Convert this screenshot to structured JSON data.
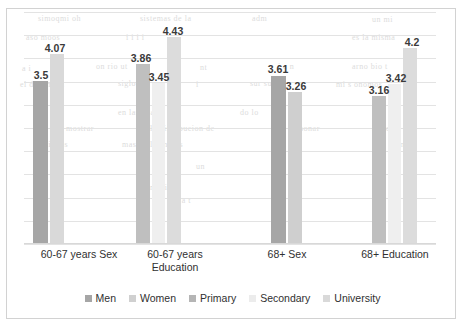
{
  "chart_data": {
    "type": "bar",
    "title": "",
    "subtitle": "",
    "xlabel": "",
    "ylabel": "",
    "ylim": [
      0,
      5
    ],
    "grid": true,
    "gridline_count": 10,
    "legend_position": "bottom",
    "axis_tick_labels": [],
    "categories": [
      "60-67 years Sex",
      "60-67 years Education",
      "68+ Sex",
      "68+ Education"
    ],
    "series": [
      {
        "name": "Men",
        "color": "#a6a6a6",
        "values": [
          3.5,
          null,
          3.61,
          null
        ]
      },
      {
        "name": "Women",
        "color": "#d9d9d9",
        "values": [
          4.07,
          null,
          3.26,
          null
        ]
      },
      {
        "name": "Primary",
        "color": "#bfbfbf",
        "values": [
          null,
          3.86,
          null,
          3.16
        ]
      },
      {
        "name": "Secondary",
        "color": "#efefef",
        "values": [
          null,
          3.45,
          null,
          3.42
        ]
      },
      {
        "name": "University",
        "color": "#dcdcdc",
        "values": [
          null,
          4.43,
          null,
          4.2
        ]
      }
    ],
    "bars": [
      {
        "group": "60-67 years Sex",
        "series": "Men",
        "value": 3.5,
        "label": "3.5",
        "color": "#a6a6a6",
        "x": 9,
        "w": 15,
        "label_x": 2,
        "label_dy": 13
      },
      {
        "group": "60-67 years Sex",
        "series": "Women",
        "value": 4.07,
        "label": "4.07",
        "color": "#d9d9d9",
        "x": 26,
        "w": 14,
        "label_x": 16,
        "label_dy": 13
      },
      {
        "group": "60-67 years Education",
        "series": "Primary",
        "value": 3.86,
        "label": "3.86",
        "color": "#bfbfbf",
        "x": 112,
        "w": 14,
        "label_x": 102,
        "label_dy": 13
      },
      {
        "group": "60-67 years Education",
        "series": "Secondary",
        "value": 3.45,
        "label": "3.45",
        "color": "#efefef",
        "x": 128,
        "w": 13,
        "label_x": 120,
        "label_dy": 13
      },
      {
        "group": "60-67 years Education",
        "series": "University",
        "value": 4.43,
        "label": "4.43",
        "color": "#dcdcdc",
        "x": 143,
        "w": 14,
        "label_x": 134,
        "label_dy": 13
      },
      {
        "group": "68+ Sex",
        "series": "Men",
        "value": 3.61,
        "label": "3.61",
        "color": "#a6a6a6",
        "x": 247,
        "w": 15,
        "label_x": 239,
        "label_dy": 13
      },
      {
        "group": "68+ Sex",
        "series": "Women",
        "value": 3.26,
        "label": "3.26",
        "color": "#cfcfcf",
        "x": 264,
        "w": 14,
        "label_x": 257,
        "label_dy": 13
      },
      {
        "group": "68+ Education",
        "series": "Primary",
        "value": 3.16,
        "label": "3.16",
        "color": "#bfbfbf",
        "x": 348,
        "w": 14,
        "label_x": 340,
        "label_dy": 13
      },
      {
        "group": "68+ Education",
        "series": "Secondary",
        "value": 3.42,
        "label": "3.42",
        "color": "#efefef",
        "x": 364,
        "w": 13,
        "label_x": 357,
        "label_dy": 13
      },
      {
        "group": "68+ Education",
        "series": "University",
        "value": 4.2,
        "label": "4.2",
        "color": "#dcdcdc",
        "x": 379,
        "w": 14,
        "label_x": 373,
        "label_dy": 13
      }
    ]
  },
  "axis": {
    "categories": [
      {
        "lines": [
          "60-67 years Sex"
        ],
        "x": 0,
        "w": 110
      },
      {
        "lines": [
          "60-67 years",
          "Education"
        ],
        "x": 96,
        "w": 110
      },
      {
        "lines": [
          "68+ Sex"
        ],
        "x": 218,
        "w": 90
      },
      {
        "lines": [
          "68+ Education"
        ],
        "x": 316,
        "w": 110
      }
    ]
  },
  "legend": {
    "items": [
      {
        "label": "Men",
        "color": "#a6a6a6"
      },
      {
        "label": "Women",
        "color": "#d0d0d0"
      },
      {
        "label": "Primary",
        "color": "#b5b5b5"
      },
      {
        "label": "Secondary",
        "color": "#ececec"
      },
      {
        "label": "University",
        "color": "#d9d9d9"
      }
    ]
  },
  "scan_artifacts": {
    "lines": [
      {
        "text": "simoqmi oh",
        "x": 38,
        "y": 14,
        "size": 8
      },
      {
        "text": "sistemas de la",
        "x": 140,
        "y": 14,
        "size": 8
      },
      {
        "text": "adm",
        "x": 252,
        "y": 14,
        "size": 8
      },
      {
        "text": "un mi",
        "x": 372,
        "y": 15,
        "size": 8
      },
      {
        "text": "aso moos",
        "x": 26,
        "y": 33,
        "size": 8
      },
      {
        "text": "i i i i",
        "x": 126,
        "y": 33,
        "size": 8
      },
      {
        "text": "es la misma",
        "x": 352,
        "y": 33,
        "size": 8
      },
      {
        "text": "a i",
        "x": 22,
        "y": 64,
        "size": 8
      },
      {
        "text": "on rio ut",
        "x": 96,
        "y": 62,
        "size": 8
      },
      {
        "text": "nt",
        "x": 200,
        "y": 63,
        "size": 8
      },
      {
        "text": "i a n",
        "x": 278,
        "y": 62,
        "size": 8
      },
      {
        "text": "arno bio t",
        "x": 352,
        "y": 62,
        "size": 8
      },
      {
        "text": "el dependon",
        "x": 20,
        "y": 80,
        "size": 8
      },
      {
        "text": "siglo II",
        "x": 118,
        "y": 79,
        "size": 8
      },
      {
        "text": "i",
        "x": 196,
        "y": 80,
        "size": 8
      },
      {
        "text": "sur sus",
        "x": 250,
        "y": 79,
        "size": 8
      },
      {
        "text": "mi s onomos",
        "x": 336,
        "y": 80,
        "size": 8
      },
      {
        "text": "en las cuatro",
        "x": 118,
        "y": 108,
        "size": 8
      },
      {
        "text": "do lo",
        "x": 240,
        "y": 108,
        "size": 8
      },
      {
        "text": "mostrar",
        "x": 66,
        "y": 124,
        "size": 8
      },
      {
        "text": "la distribucion de",
        "x": 150,
        "y": 124,
        "size": 8
      },
      {
        "text": "sonar",
        "x": 300,
        "y": 124,
        "size": 8
      },
      {
        "text": "lidad",
        "x": 372,
        "y": 124,
        "size": 8
      },
      {
        "text": "ancianos",
        "x": 36,
        "y": 140,
        "size": 8
      },
      {
        "text": "mas de los ninos",
        "x": 122,
        "y": 140,
        "size": 8
      },
      {
        "text": "i on",
        "x": 272,
        "y": 140,
        "size": 8
      },
      {
        "text": "an",
        "x": 396,
        "y": 140,
        "size": 8
      },
      {
        "text": "un",
        "x": 196,
        "y": 162,
        "size": 8
      },
      {
        "text": "mil ioi",
        "x": 150,
        "y": 183,
        "size": 8
      },
      {
        "text": "f a t",
        "x": 176,
        "y": 196,
        "size": 8
      }
    ]
  }
}
